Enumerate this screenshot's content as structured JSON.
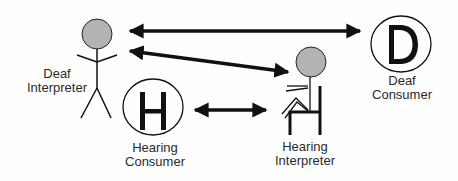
{
  "diagram": {
    "title": "",
    "nodes": [
      {
        "id": "deaf-interpreter",
        "label_lines": [
          "Deaf",
          "Interpreter"
        ],
        "figure": "standing stick figure",
        "head_color": "#b3b3b3"
      },
      {
        "id": "hearing-interpreter",
        "label_lines": [
          "Hearing",
          "Interpreter"
        ],
        "figure": "seated stick figure on chair",
        "head_color": "#b3b3b3"
      },
      {
        "id": "hearing-consumer",
        "label_lines": [
          "Hearing",
          "Consumer"
        ],
        "symbol_letter": "H"
      },
      {
        "id": "deaf-consumer",
        "label_lines": [
          "Deaf",
          "Consumer"
        ],
        "symbol_letter": "D"
      }
    ],
    "edges": [
      {
        "from": "deaf-interpreter",
        "to": "deaf-consumer",
        "direction": "both"
      },
      {
        "from": "deaf-interpreter",
        "to": "hearing-interpreter",
        "direction": "both"
      },
      {
        "from": "hearing-consumer",
        "to": "hearing-interpreter",
        "direction": "both"
      }
    ],
    "colors": {
      "line": "#111111",
      "head_fill": "#b3b3b3",
      "text": "#2a2a2a"
    }
  }
}
